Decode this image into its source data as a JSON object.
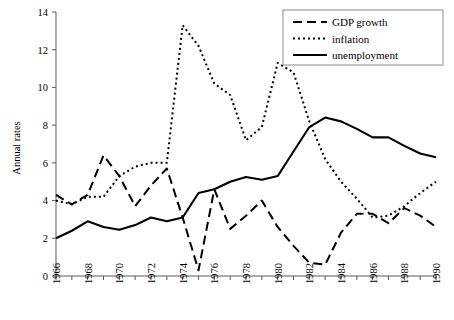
{
  "chart_data": {
    "type": "line",
    "title": "",
    "xlabel": "",
    "ylabel": "Annual rates",
    "xlim": [
      1966,
      1990
    ],
    "ylim": [
      0,
      14
    ],
    "ytick_step": 2,
    "yticks": [
      "0",
      "2",
      "4",
      "6",
      "8",
      "10",
      "12",
      "14"
    ],
    "xticks_labeled": [
      "1966",
      "1968",
      "1970",
      "1972",
      "1974",
      "1976",
      "1978",
      "1980",
      "1982",
      "1984",
      "1986",
      "1988",
      "1990"
    ],
    "xtick_minor_every": 1,
    "grid": false,
    "legend_position": "top-right",
    "x": [
      1966,
      1967,
      1968,
      1969,
      1970,
      1971,
      1972,
      1973,
      1974,
      1975,
      1976,
      1977,
      1978,
      1979,
      1980,
      1981,
      1982,
      1983,
      1984,
      1985,
      1986,
      1987,
      1988,
      1989,
      1990
    ],
    "series": [
      {
        "name": "GDP growth",
        "style": "dashed",
        "color": "#000000",
        "values": [
          4.3,
          3.8,
          4.3,
          6.4,
          5.3,
          3.7,
          4.8,
          5.7,
          3.1,
          0.3,
          4.6,
          2.5,
          3.2,
          4.0,
          2.6,
          1.6,
          0.7,
          0.6,
          2.3,
          3.3,
          3.3,
          2.8,
          3.6,
          3.2,
          2.6
        ]
      },
      {
        "name": "inflation",
        "style": "dotted",
        "color": "#000000",
        "values": [
          4.0,
          3.8,
          4.2,
          4.2,
          5.3,
          5.8,
          6.0,
          6.0,
          13.3,
          12.2,
          10.2,
          9.6,
          7.2,
          7.9,
          11.3,
          10.8,
          8.2,
          6.2,
          5.0,
          4.1,
          3.1,
          3.2,
          3.7,
          4.4,
          5.0
        ]
      },
      {
        "name": "unemployment",
        "style": "solid",
        "color": "#000000",
        "values": [
          2.0,
          2.4,
          2.9,
          2.6,
          2.45,
          2.7,
          3.1,
          2.9,
          3.1,
          4.4,
          4.6,
          5.0,
          5.25,
          5.1,
          5.3,
          6.6,
          7.9,
          8.4,
          8.2,
          7.8,
          7.35,
          7.35,
          6.9,
          6.5,
          6.3
        ]
      }
    ]
  },
  "legend": {
    "items": [
      {
        "label": "GDP growth",
        "style": "dashed"
      },
      {
        "label": "inflation",
        "style": "dotted"
      },
      {
        "label": "unemployment",
        "style": "solid"
      }
    ]
  },
  "axes": {
    "y_title": "Annual rates"
  }
}
